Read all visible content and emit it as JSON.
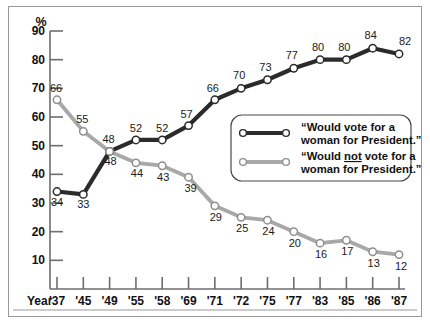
{
  "chart_data": {
    "type": "line",
    "title": "",
    "xlabel": "Year",
    "ylabel": "%",
    "ylim": [
      0,
      90
    ],
    "yticks": [
      10,
      20,
      30,
      40,
      50,
      60,
      70,
      80,
      90
    ],
    "grid": false,
    "legend_position": "inside-right",
    "categories": [
      "'37",
      "'45",
      "'49",
      "'55",
      "'58",
      "'69",
      "'71",
      "'72",
      "'75",
      "'77",
      "'83",
      "'85",
      "'86",
      "'87"
    ],
    "series": [
      {
        "name": "“Would vote for a woman for President.”",
        "color": "#2b2b2b",
        "values": [
          34,
          33,
          48,
          52,
          52,
          57,
          66,
          70,
          73,
          77,
          80,
          80,
          84,
          82
        ]
      },
      {
        "name": "“Would not vote for a woman for President.”",
        "color": "#a8a8a8",
        "values": [
          66,
          55,
          48,
          44,
          43,
          39,
          29,
          25,
          24,
          20,
          16,
          17,
          13,
          12
        ]
      }
    ]
  },
  "axes": {
    "y_unit": "%",
    "x_axis_caption": "Year"
  },
  "legend": {
    "entries": [
      {
        "marker": "line-with-open-circles",
        "color": "#2b2b2b",
        "line1": "“Would vote for a",
        "line2": "woman for President.”",
        "underline_word": ""
      },
      {
        "marker": "line-with-open-circles",
        "color": "#a8a8a8",
        "line1_pre": "“Would ",
        "line1_underlined": "not",
        "line1_post": " vote for a",
        "line2": "woman for President.”",
        "underline_word": "not"
      }
    ]
  },
  "colors": {
    "series_vote": "#2b2b2b",
    "series_not_vote": "#a8a8a8",
    "axis": "#6e6e6e",
    "frame": "#9a9a9a",
    "text": "#111111"
  }
}
